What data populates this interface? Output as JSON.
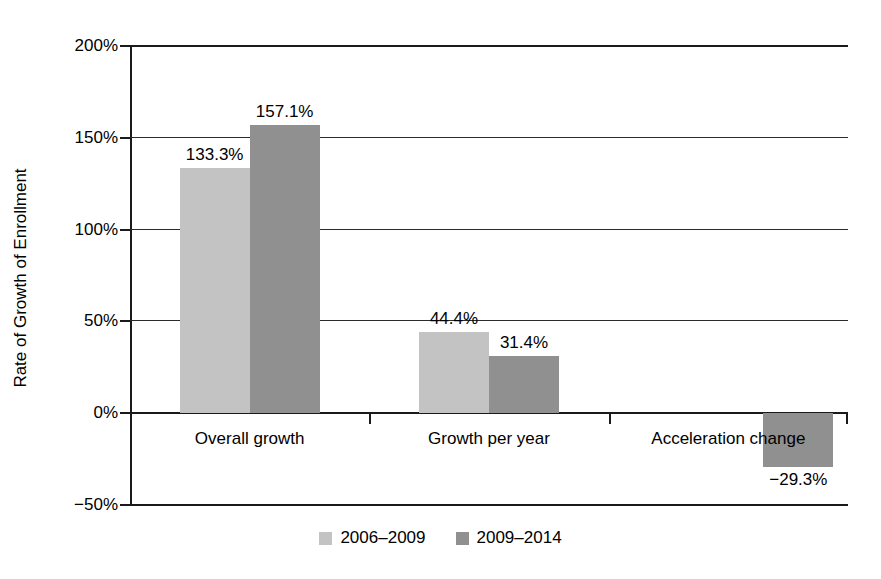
{
  "chart_data": {
    "type": "bar",
    "title": "",
    "xlabel": "",
    "ylabel": "Rate of Growth of Enrollment",
    "categories": [
      "Overall growth",
      "Growth per year",
      "Acceleration change"
    ],
    "series": [
      {
        "name": "2006–2009",
        "color": "#c3c3c3",
        "values": [
          133.3,
          44.4,
          null
        ],
        "labels": [
          "133.3%",
          "44.4%",
          ""
        ]
      },
      {
        "name": "2009–2014",
        "color": "#909090",
        "values": [
          157.1,
          31.4,
          -29.3
        ],
        "labels": [
          "157.1%",
          "31.4%",
          "−29.3%"
        ]
      }
    ],
    "ylim": [
      -50,
      200
    ],
    "yticks": [
      200,
      150,
      100,
      50,
      0,
      -50
    ],
    "ytick_labels": [
      "200%",
      "150%",
      "100%",
      "50%",
      "0%",
      "−50%"
    ],
    "grid": true,
    "legend_position": "bottom",
    "units": "percent"
  },
  "axis": {
    "y_title": "Rate of Growth of Enrollment"
  },
  "legend": {
    "items": [
      {
        "label": "2006–2009",
        "swatch": "light-gray-swatch"
      },
      {
        "label": "2009–2014",
        "swatch": "dark-gray-swatch"
      }
    ]
  }
}
